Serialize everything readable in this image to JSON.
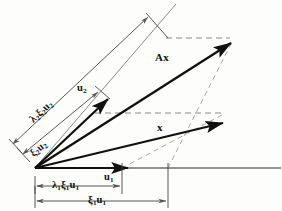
{
  "figure": {
    "background_color": "#fdfdfc",
    "ink_color": "#111111",
    "dashed_color": "#8f8f8f",
    "thin_color": "#6b6b6b"
  },
  "labels": {
    "lambda2_xi2_u2": {
      "lambda": "λ",
      "lambda_sub": "2",
      "xi": "ξ",
      "xi_sub": "2",
      "u": "u",
      "u_sub": "2"
    },
    "xi2_u2": {
      "xi": "ξ",
      "xi_sub": "2",
      "u": "u",
      "u_sub": "2"
    },
    "lambda1_xi1_u1": {
      "lambda": "λ",
      "lambda_sub": "1",
      "xi": "ξ",
      "xi_sub": "1",
      "u": "u",
      "u_sub": "1"
    },
    "xi1_u1": {
      "xi": "ξ",
      "xi_sub": "1",
      "u": "u",
      "u_sub": "1"
    },
    "u1": {
      "u": "u",
      "u_sub": "1"
    },
    "u2": {
      "u": "u",
      "u_sub": "2"
    },
    "Ax": "Ax",
    "x": "x"
  },
  "geometry": {
    "origin": {
      "x": 35,
      "y": 168
    },
    "axis_y": 168,
    "axis_x_end": 281,
    "vectors": [
      {
        "name": "u1",
        "tip_x": 130,
        "tip_y": 168
      },
      {
        "name": "u2",
        "tip_x": 110,
        "tip_y": 97
      },
      {
        "name": "x",
        "tip_x": 225,
        "tip_y": 122
      },
      {
        "name": "Ax",
        "tip_x": 233,
        "tip_y": 41
      }
    ],
    "dimension_lines": [
      {
        "name": "lambda1-xi1-u1",
        "x1": 35,
        "x2": 122,
        "y": 186
      },
      {
        "name": "xi1-u1",
        "x1": 35,
        "x2": 168,
        "y": 201
      },
      {
        "name": "xi2-u2",
        "x1": 22,
        "y1": 155,
        "x2": 100,
        "y2": 90
      },
      {
        "name": "lambda2-xi2-u2",
        "x1": 12,
        "y1": 145,
        "x2": 150,
        "y2": 15
      }
    ],
    "dashed_lines": [
      {
        "name": "upper-horizontal-dashed",
        "x1": 168,
        "y1": 38,
        "x2": 232,
        "y2": 38
      },
      {
        "name": "mid-horizontal-dashed",
        "x1": 96,
        "y1": 113,
        "x2": 224,
        "y2": 113
      },
      {
        "name": "x-parallel-dashed",
        "x1": 122,
        "y1": 168,
        "x2": 224,
        "y2": 114
      },
      {
        "name": "Ax-parallel-dashed",
        "x1": 168,
        "y1": 168,
        "x2": 232,
        "y2": 40
      }
    ]
  }
}
